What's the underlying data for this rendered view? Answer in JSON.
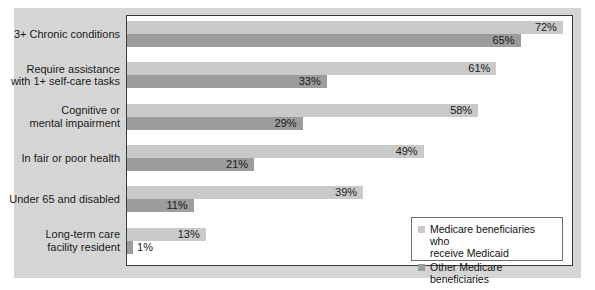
{
  "chart_data": {
    "type": "bar",
    "orientation": "horizontal",
    "title": "",
    "xlabel": "",
    "ylabel": "",
    "xlim": [
      0,
      72
    ],
    "grid": false,
    "legend_position": "bottom-right",
    "categories": [
      "3+ Chronic conditions",
      "Require assistance with 1+ self-care tasks",
      "Cognitive or mental impairment",
      "In fair or poor health",
      "Under 65 and disabled",
      "Long-term care facility resident"
    ],
    "category_lines": [
      [
        "3+ Chronic conditions"
      ],
      [
        "Require assistance",
        "with 1+ self-care tasks"
      ],
      [
        "Cognitive or",
        "mental impairment"
      ],
      [
        "In fair or poor health"
      ],
      [
        "Under 65 and disabled"
      ],
      [
        "Long-term care",
        "facility resident"
      ]
    ],
    "series": [
      {
        "name": "Medicare beneficiaries who receive Medicaid",
        "color": "#c9c9c9",
        "values": [
          72,
          61,
          58,
          49,
          39,
          13
        ],
        "labels": [
          "72%",
          "61%",
          "58%",
          "49%",
          "39%",
          "13%"
        ]
      },
      {
        "name": "Other Medicare beneficiaries",
        "color": "#9c9c9c",
        "values": [
          65,
          33,
          29,
          21,
          11,
          1
        ],
        "labels": [
          "65%",
          "33%",
          "29%",
          "21%",
          "11%",
          "1%"
        ]
      }
    ]
  },
  "legend": {
    "entries": [
      {
        "swatch": "light",
        "line1": "Medicare beneficiaries who",
        "line2": "receive Medicaid"
      },
      {
        "swatch": "dark",
        "line1": "Other Medicare beneficiaries",
        "line2": ""
      }
    ]
  },
  "colors": {
    "series_light": "#c9c9c9",
    "series_dark": "#9c9c9c",
    "panel_background": "#d5d5d5",
    "plot_background": "#ffffff",
    "text": "#1a1a1a"
  }
}
